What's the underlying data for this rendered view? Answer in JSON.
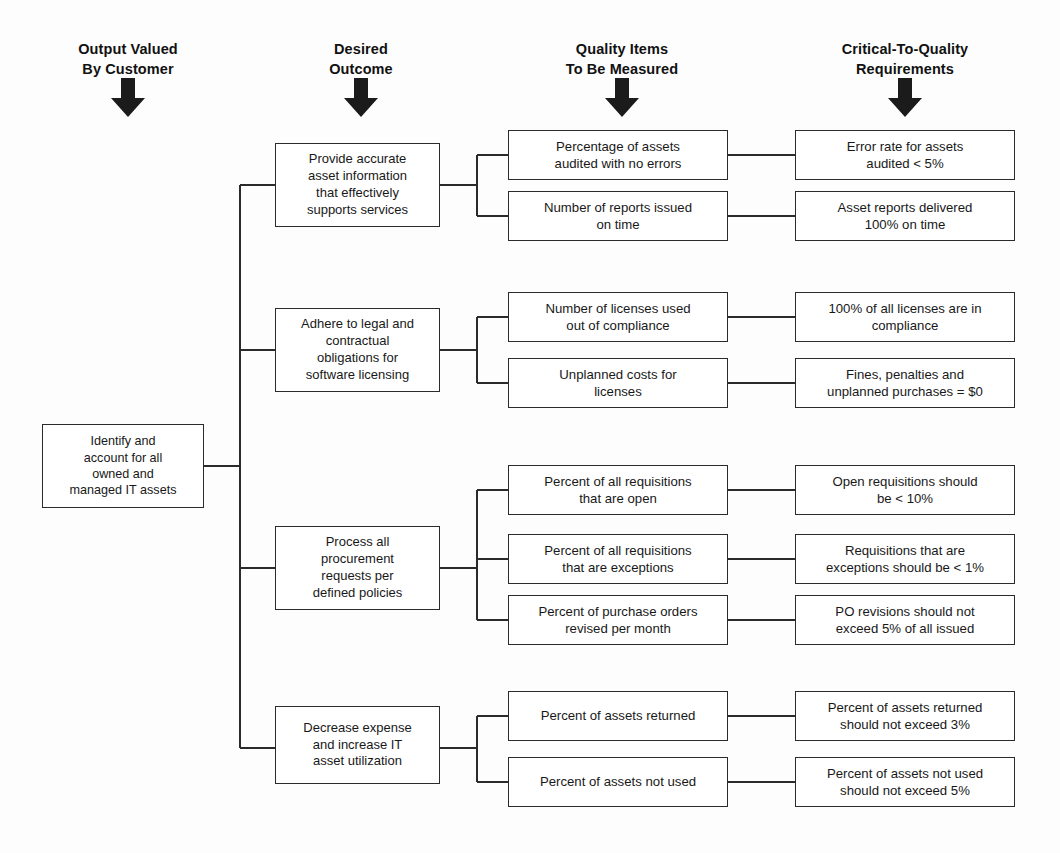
{
  "diagram": {
    "type": "ctq-tree",
    "background_color": "#fdfdfd",
    "line_color": "#2b2b2b",
    "columns": [
      {
        "id": "output",
        "label": "Output Valued\nBy Customer",
        "icon": "down-arrow-icon"
      },
      {
        "id": "outcome",
        "label": "Desired\nOutcome",
        "icon": "down-arrow-icon"
      },
      {
        "id": "quality",
        "label": "Quality Items\nTo Be Measured",
        "icon": "down-arrow-icon"
      },
      {
        "id": "ctq",
        "label": "Critical-To-Quality\nRequirements",
        "icon": "down-arrow-icon"
      }
    ],
    "root": {
      "label": "Identify and\naccount for all\nowned and\nmanaged IT assets"
    },
    "branches": [
      {
        "outcome": "Provide accurate\nasset information\nthat effectively\nsupports services",
        "items": [
          {
            "quality": "Percentage of assets\naudited with no errors",
            "ctq": "Error rate for assets\naudited < 5%"
          },
          {
            "quality": "Number of reports issued\non time",
            "ctq": "Asset reports delivered\n100% on time"
          }
        ]
      },
      {
        "outcome": "Adhere to legal and\ncontractual\nobligations for\nsoftware licensing",
        "items": [
          {
            "quality": "Number of licenses used\nout of compliance",
            "ctq": "100% of all licenses are in\ncompliance"
          },
          {
            "quality": "Unplanned costs for\nlicenses",
            "ctq": "Fines, penalties and\nunplanned purchases = $0"
          }
        ]
      },
      {
        "outcome": "Process all\nprocurement\nrequests per\ndefined policies",
        "items": [
          {
            "quality": "Percent of all requisitions\nthat are open",
            "ctq": "Open requisitions should\nbe < 10%"
          },
          {
            "quality": "Percent of all requisitions\nthat are exceptions",
            "ctq": "Requisitions that are\nexceptions should be < 1%"
          },
          {
            "quality": "Percent of purchase orders\nrevised per month",
            "ctq": "PO revisions should not\nexceed 5% of all issued"
          }
        ]
      },
      {
        "outcome": "Decrease expense\nand increase IT\nasset utilization",
        "items": [
          {
            "quality": "Percent of assets returned",
            "ctq": "Percent of assets returned\nshould not exceed 3%"
          },
          {
            "quality": "Percent of assets not used",
            "ctq": "Percent of assets not used\nshould not exceed 5%"
          }
        ]
      }
    ]
  }
}
